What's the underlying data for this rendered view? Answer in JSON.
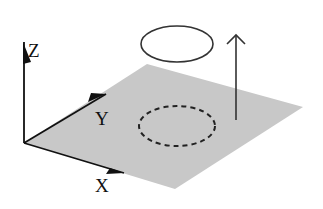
{
  "diagram": {
    "axes": {
      "z_label": "Z",
      "y_label": "Y",
      "x_label": "X"
    },
    "colors": {
      "plane_fill": "#c8c8c8",
      "stroke": "#111111",
      "ellipse_stroke": "#333333",
      "background": "#ffffff"
    }
  }
}
